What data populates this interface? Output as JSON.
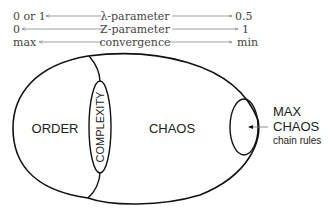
{
  "scales": [
    {
      "left": "0 or 1",
      "label": "λ-parameter",
      "right": "0.5"
    },
    {
      "left": "0",
      "label": "Z-parameter",
      "right": "1"
    },
    {
      "left": "max",
      "label": "convergence",
      "right": "min"
    }
  ],
  "regions": {
    "order": "ORDER",
    "complexity": "COMPLEXITY",
    "chaos": "CHAOS"
  },
  "callout": {
    "line1": "MAX",
    "line2": "CHAOS",
    "line3": "chain rules"
  },
  "colors": {
    "stroke": "#111111",
    "arrow": "#777777",
    "text": "#222222",
    "scale_text": "#444444"
  }
}
